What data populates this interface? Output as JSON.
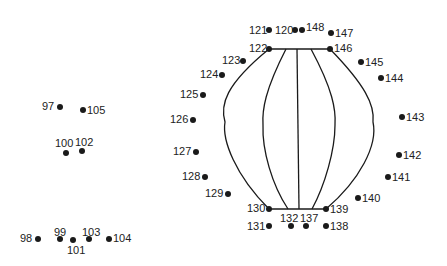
{
  "puzzle": {
    "type": "connect-the-dots",
    "line_color": "#1a1a1a",
    "dot_color": "#1a1a1a",
    "points": [
      {
        "n": "97",
        "x": 60,
        "y": 107,
        "lx": 42,
        "ly": 101
      },
      {
        "n": "105",
        "x": 83,
        "y": 110,
        "lx": 87,
        "ly": 105
      },
      {
        "n": "100",
        "x": 66,
        "y": 153,
        "lx": 55,
        "ly": 138
      },
      {
        "n": "102",
        "x": 82,
        "y": 151,
        "lx": 75,
        "ly": 137
      },
      {
        "n": "98",
        "x": 38,
        "y": 239,
        "lx": 20,
        "ly": 233
      },
      {
        "n": "99",
        "x": 60,
        "y": 239,
        "lx": 54,
        "ly": 227
      },
      {
        "n": "101",
        "x": 73,
        "y": 240,
        "lx": 67,
        "ly": 245
      },
      {
        "n": "103",
        "x": 89,
        "y": 239,
        "lx": 82,
        "ly": 227
      },
      {
        "n": "104",
        "x": 109,
        "y": 239,
        "lx": 113,
        "ly": 233
      },
      {
        "n": "121",
        "x": 269,
        "y": 30,
        "lx": 249,
        "ly": 25
      },
      {
        "n": "120",
        "x": 295,
        "y": 30,
        "lx": 275,
        "ly": 25
      },
      {
        "n": "148",
        "x": 302,
        "y": 30,
        "lx": 306,
        "ly": 22
      },
      {
        "n": "147",
        "x": 331,
        "y": 33,
        "lx": 335,
        "ly": 28
      },
      {
        "n": "122",
        "x": 269,
        "y": 49,
        "lx": 249,
        "ly": 43
      },
      {
        "n": "146",
        "x": 330,
        "y": 49,
        "lx": 334,
        "ly": 43
      },
      {
        "n": "123",
        "x": 243,
        "y": 61,
        "lx": 222,
        "ly": 55
      },
      {
        "n": "145",
        "x": 361,
        "y": 62,
        "lx": 365,
        "ly": 57
      },
      {
        "n": "124",
        "x": 222,
        "y": 75,
        "lx": 200,
        "ly": 69
      },
      {
        "n": "144",
        "x": 381,
        "y": 78,
        "lx": 385,
        "ly": 73
      },
      {
        "n": "125",
        "x": 203,
        "y": 95,
        "lx": 180,
        "ly": 89
      },
      {
        "n": "126",
        "x": 193,
        "y": 120,
        "lx": 170,
        "ly": 114
      },
      {
        "n": "143",
        "x": 402,
        "y": 117,
        "lx": 406,
        "ly": 112
      },
      {
        "n": "127",
        "x": 196,
        "y": 152,
        "lx": 173,
        "ly": 146
      },
      {
        "n": "142",
        "x": 399,
        "y": 155,
        "lx": 403,
        "ly": 150
      },
      {
        "n": "128",
        "x": 205,
        "y": 177,
        "lx": 182,
        "ly": 171
      },
      {
        "n": "141",
        "x": 388,
        "y": 177,
        "lx": 392,
        "ly": 172
      },
      {
        "n": "129",
        "x": 228,
        "y": 194,
        "lx": 205,
        "ly": 188
      },
      {
        "n": "140",
        "x": 358,
        "y": 198,
        "lx": 362,
        "ly": 193
      },
      {
        "n": "130",
        "x": 269,
        "y": 209,
        "lx": 247,
        "ly": 203
      },
      {
        "n": "139",
        "x": 326,
        "y": 209,
        "lx": 330,
        "ly": 204
      },
      {
        "n": "131",
        "x": 269,
        "y": 226,
        "lx": 247,
        "ly": 221
      },
      {
        "n": "132",
        "x": 291,
        "y": 226,
        "lx": 280,
        "ly": 213
      },
      {
        "n": "137",
        "x": 306,
        "y": 226,
        "lx": 300,
        "ly": 213
      },
      {
        "n": "138",
        "x": 326,
        "y": 226,
        "lx": 330,
        "ly": 221
      }
    ]
  }
}
